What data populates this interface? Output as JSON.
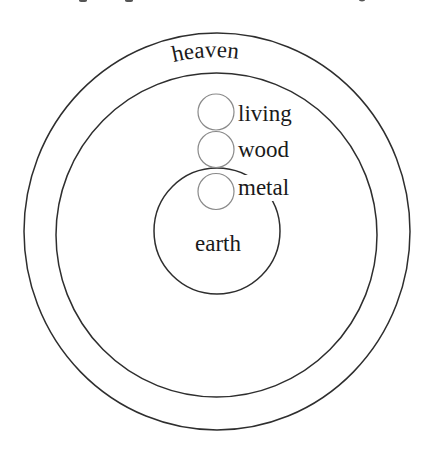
{
  "diagram": {
    "rings": {
      "heaven": {
        "label": "heaven"
      },
      "earth": {
        "label": "earth"
      }
    },
    "elements": [
      {
        "label": "living"
      },
      {
        "label": "wood"
      },
      {
        "label": "metal"
      }
    ],
    "colors": {
      "line": "#2e2e2e",
      "small_circle": "#8a8a8a",
      "text": "#1a1a1a",
      "background": "#ffffff"
    }
  }
}
